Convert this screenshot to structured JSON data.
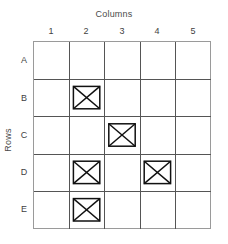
{
  "figure": {
    "columns_title": "Columns",
    "rows_title": "Rows",
    "column_headers": [
      "1",
      "2",
      "3",
      "4",
      "5"
    ],
    "row_headers": [
      "A",
      "B",
      "C",
      "D",
      "E"
    ],
    "grid_line_color": "#555555",
    "mark_color": "#111111",
    "text_color": "#3f3f3f",
    "background_color": "#ffffff"
  },
  "chart_data": {
    "type": "heatmap",
    "title": "",
    "xlabel": "Columns",
    "ylabel": "Rows",
    "x": [
      "1",
      "2",
      "3",
      "4",
      "5"
    ],
    "y": [
      "A",
      "B",
      "C",
      "D",
      "E"
    ],
    "grid": true,
    "legend": "none",
    "mark_symbol": "crossed-box",
    "values": [
      [
        0,
        0,
        0,
        0,
        0
      ],
      [
        0,
        1,
        0,
        0,
        0
      ],
      [
        0,
        0,
        1,
        0,
        0
      ],
      [
        0,
        1,
        0,
        1,
        0
      ],
      [
        0,
        1,
        0,
        0,
        0
      ]
    ],
    "marked_cells": [
      "B2",
      "C3",
      "D2",
      "D4",
      "E2"
    ],
    "marked_count": 5,
    "total_cells": 25
  }
}
